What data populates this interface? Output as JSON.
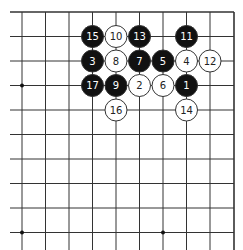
{
  "board": {
    "type": "go-diagram",
    "grid": {
      "x": [
        22,
        45.5,
        69,
        92.5,
        116,
        139.5,
        163,
        186.5,
        210,
        234
      ],
      "y": [
        12,
        36.5,
        61,
        85.5,
        110,
        134.5,
        159,
        183.5,
        208,
        232.5
      ],
      "left_extend": 10,
      "bottom_extend": 250,
      "top_edge": true,
      "right_edge": true
    },
    "colors": {
      "line": "#333333",
      "black_stone": "#111111",
      "white_stone": "#ffffff",
      "stone_border": "#333333"
    },
    "star_points": [
      {
        "col": 0,
        "row": 3
      },
      {
        "col": 0,
        "row": 9
      },
      {
        "col": 6,
        "row": 9
      }
    ],
    "stones": [
      {
        "move": "1",
        "color": "black",
        "col": 7,
        "row": 3
      },
      {
        "move": "2",
        "color": "white",
        "col": 5,
        "row": 3
      },
      {
        "move": "3",
        "color": "black",
        "col": 3,
        "row": 2
      },
      {
        "move": "4",
        "color": "white",
        "col": 7,
        "row": 2
      },
      {
        "move": "5",
        "color": "black",
        "col": 6,
        "row": 2
      },
      {
        "move": "6",
        "color": "white",
        "col": 6,
        "row": 3
      },
      {
        "move": "7",
        "color": "black",
        "col": 5,
        "row": 2
      },
      {
        "move": "8",
        "color": "white",
        "col": 4,
        "row": 2
      },
      {
        "move": "9",
        "color": "black",
        "col": 4,
        "row": 3
      },
      {
        "move": "10",
        "color": "white",
        "col": 4,
        "row": 1
      },
      {
        "move": "11",
        "color": "black",
        "col": 7,
        "row": 1
      },
      {
        "move": "12",
        "color": "white",
        "col": 8,
        "row": 2
      },
      {
        "move": "13",
        "color": "black",
        "col": 5,
        "row": 1
      },
      {
        "move": "14",
        "color": "white",
        "col": 7,
        "row": 4
      },
      {
        "move": "15",
        "color": "black",
        "col": 3,
        "row": 1
      },
      {
        "move": "16",
        "color": "white",
        "col": 4,
        "row": 4
      },
      {
        "move": "17",
        "color": "black",
        "col": 3,
        "row": 3
      }
    ]
  }
}
